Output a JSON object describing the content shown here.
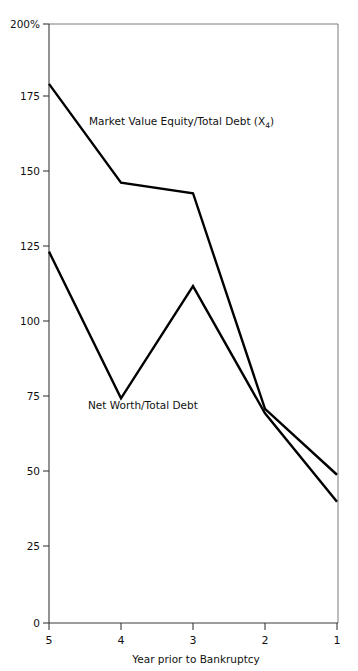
{
  "chart_data": {
    "type": "line",
    "title": "",
    "subtitle": "",
    "xlabel": "Year prior to Bankruptcy",
    "ylabel": "",
    "x": [
      5,
      4,
      3,
      2,
      1
    ],
    "xtick_labels": [
      "5",
      "4",
      "3",
      "2",
      "1"
    ],
    "x_axis_inverted": true,
    "xlim": [
      5,
      1
    ],
    "ylim": [
      0,
      200
    ],
    "ytick_labels": [
      "0",
      "25",
      "50",
      "75",
      "100",
      "125",
      "150",
      "175",
      "200%"
    ],
    "ytick_values": [
      0,
      25,
      50,
      75,
      100,
      125,
      150,
      175,
      200
    ],
    "grid": false,
    "legend_position": "inline-annotations",
    "series": [
      {
        "name": "Market Value Equity/Total Debt (X4)",
        "label_main": "Market Value Equity/Total Debt (X",
        "label_sub": "4",
        "label_tail": ")",
        "values": [
          180,
          147,
          143.5,
          71.5,
          49.5
        ],
        "color": "#000000"
      },
      {
        "name": "Net Worth/Total Debt",
        "label_main": "Net Worth/Total Debt",
        "label_sub": "",
        "label_tail": "",
        "values": [
          124,
          75,
          112.5,
          70,
          40.5
        ],
        "color": "#000000"
      }
    ],
    "annotations": [
      {
        "text": "Market Value Equity/Total Debt (X4)",
        "x": 4.1,
        "y": 161
      },
      {
        "text": "Net Worth/Total Debt",
        "x": 3.95,
        "y": 69
      }
    ]
  },
  "axes": {
    "y_axis_top_label": "200%",
    "x_axis_caption": "Year prior to Bankruptcy"
  },
  "colors": {
    "line": "#000000",
    "axis": "#3a3a3a",
    "frame": "#7a7a7a",
    "background": "#ffffff",
    "text": "#111111"
  }
}
